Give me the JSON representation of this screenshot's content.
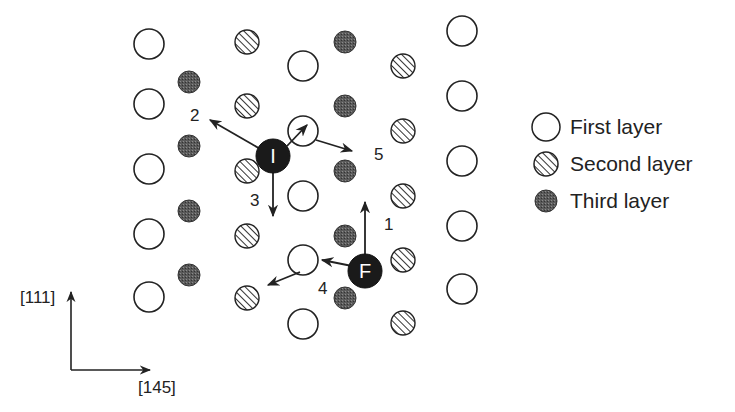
{
  "figure": {
    "colors": {
      "background": "#ffffff",
      "stroke": "#222222",
      "third_layer_fill": "#555555",
      "defect_fill": "#1a1a1a"
    },
    "legend": [
      {
        "key": "first",
        "label": "First layer",
        "symbol": "open-circle"
      },
      {
        "key": "second",
        "label": "Second layer",
        "symbol": "hatched-circle"
      },
      {
        "key": "third",
        "label": "Third layer",
        "symbol": "dark-dotted-circle"
      }
    ],
    "axes": {
      "vertical_label": "[111]",
      "horizontal_label": "[145]"
    },
    "atoms": {
      "first_layer": [
        [
          149,
          44
        ],
        [
          149,
          104
        ],
        [
          149,
          169
        ],
        [
          149,
          234
        ],
        [
          149,
          297
        ],
        [
          303,
          66
        ],
        [
          303,
          131
        ],
        [
          303,
          196
        ],
        [
          303,
          260
        ],
        [
          303,
          324
        ],
        [
          462,
          31
        ],
        [
          462,
          96
        ],
        [
          462,
          161
        ],
        [
          462,
          226
        ],
        [
          462,
          289
        ]
      ],
      "second_layer": [
        [
          247,
          42
        ],
        [
          247,
          106
        ],
        [
          247,
          171
        ],
        [
          247,
          236
        ],
        [
          247,
          298
        ],
        [
          403,
          66
        ],
        [
          403,
          131
        ],
        [
          403,
          196
        ],
        [
          403,
          260
        ],
        [
          403,
          323
        ]
      ],
      "third_layer": [
        [
          189,
          82
        ],
        [
          189,
          146
        ],
        [
          189,
          211
        ],
        [
          189,
          275
        ],
        [
          345,
          42
        ],
        [
          345,
          106
        ],
        [
          345,
          171
        ],
        [
          345,
          236
        ],
        [
          345,
          298
        ]
      ]
    },
    "defects": [
      {
        "label": "I",
        "x": 273,
        "y": 156
      },
      {
        "label": "F",
        "x": 365,
        "y": 271
      }
    ],
    "jumps": [
      {
        "label": "1",
        "from": [
          365,
          260
        ],
        "to": [
          365,
          202
        ],
        "label_pos": [
          384,
          230
        ]
      },
      {
        "label": "2",
        "from": [
          262,
          150
        ],
        "to": [
          210,
          120
        ],
        "label_pos": [
          190,
          121
        ]
      },
      {
        "label": "3",
        "from": [
          273,
          170
        ],
        "to": [
          273,
          216
        ],
        "label_pos": [
          250,
          206
        ]
      },
      {
        "label": "4",
        "from": [
          300,
          272
        ],
        "to": [
          268,
          285
        ],
        "label_pos": [
          318,
          294
        ]
      },
      {
        "label": "5",
        "from": [
          316,
          140
        ],
        "to": [
          352,
          151
        ],
        "label_pos": [
          374,
          160
        ]
      },
      {
        "label": "",
        "from": [
          287,
          146
        ],
        "to": [
          307,
          125
        ],
        "label_pos": null
      },
      {
        "label": "",
        "from": [
          352,
          266
        ],
        "to": [
          322,
          260
        ],
        "label_pos": null
      }
    ]
  }
}
